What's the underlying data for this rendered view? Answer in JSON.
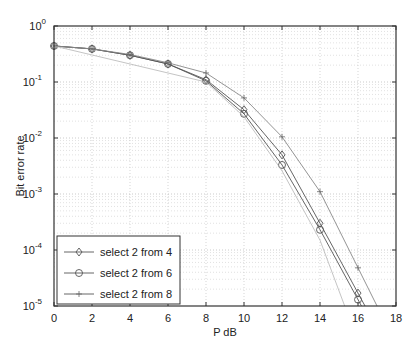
{
  "chart_data": {
    "type": "line",
    "title": "",
    "xlabel": "P dB",
    "ylabel": "Bit error rate",
    "xlim": [
      0,
      18
    ],
    "ylim": [
      1e-05,
      1
    ],
    "yscale": "log",
    "grid": true,
    "legend_position": "lower left",
    "x_ticks": [
      "0",
      "2",
      "4",
      "6",
      "8",
      "10",
      "12",
      "14",
      "16",
      "18"
    ],
    "y_ticks": [
      "10^0",
      "10^-1",
      "10^-2",
      "10^-3",
      "10^-4",
      "10^-5"
    ],
    "x": [
      0,
      2,
      4,
      6,
      8,
      10,
      12,
      14,
      16
    ],
    "series": [
      {
        "name": "select 2 from 4",
        "marker": "diamond",
        "values": [
          0.44,
          0.39,
          0.3,
          0.21,
          0.11,
          0.032,
          0.005,
          0.0003,
          1.7e-05
        ]
      },
      {
        "name": "select 2 from 6",
        "marker": "circle",
        "values": [
          0.44,
          0.39,
          0.3,
          0.21,
          0.105,
          0.027,
          0.0033,
          0.00023,
          1.3e-05
        ]
      },
      {
        "name": "select 2 from 8",
        "marker": "star",
        "values": [
          0.44,
          0.39,
          0.31,
          0.22,
          0.145,
          0.052,
          0.0105,
          0.0011,
          4.8e-05
        ]
      }
    ]
  },
  "axes": {
    "xlabel": "P dB",
    "ylabel": "Bit error rate",
    "x_ticks": [
      "0",
      "2",
      "4",
      "6",
      "8",
      "10",
      "12",
      "14",
      "16",
      "18"
    ],
    "y_exponents": [
      "0",
      "-1",
      "-2",
      "-3",
      "-4",
      "-5"
    ]
  },
  "legend": [
    {
      "label": "select 2 from 4"
    },
    {
      "label": "select 2 from 6"
    },
    {
      "label": "select 2 from 8"
    }
  ]
}
